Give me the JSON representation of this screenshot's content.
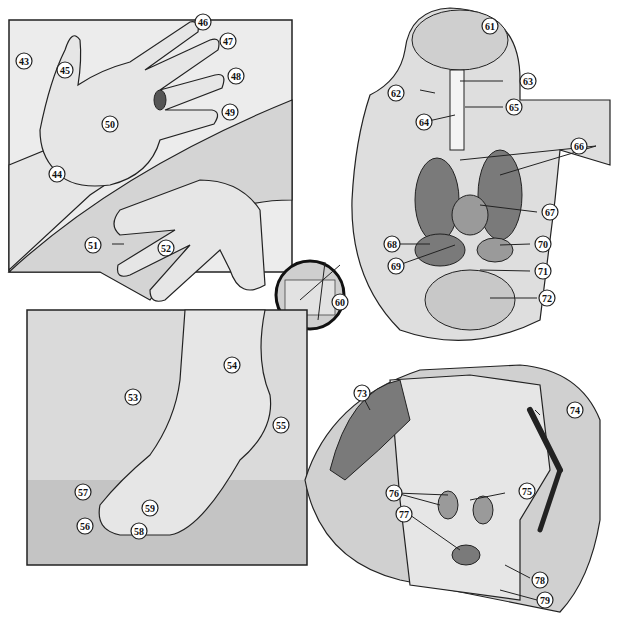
{
  "panels": [
    {
      "id": "hands",
      "description": "Palm and back of hands",
      "labels": [
        "43",
        "44",
        "45",
        "46",
        "47",
        "48",
        "49",
        "50",
        "51",
        "52"
      ]
    },
    {
      "id": "hair-follicle-inset",
      "description": "Magnified skin section with hair follicle",
      "labels": [
        "60"
      ]
    },
    {
      "id": "head-torso-organs",
      "description": "Sagittal head and torso showing internal organs",
      "labels": [
        "61",
        "62",
        "63",
        "64",
        "65",
        "66",
        "67",
        "68",
        "69",
        "70",
        "71",
        "72"
      ]
    },
    {
      "id": "foot",
      "description": "Foot standing on wooden floor",
      "labels": [
        "53",
        "54",
        "55",
        "56",
        "57",
        "58",
        "59"
      ]
    },
    {
      "id": "torso-muscles-skeleton",
      "description": "Torso with muscles, skeleton arm, kidneys and bladder",
      "labels": [
        "73",
        "74",
        "75",
        "76",
        "77",
        "78",
        "79"
      ]
    }
  ],
  "labels": {
    "l43": "43",
    "l44": "44",
    "l45": "45",
    "l46": "46",
    "l47": "47",
    "l48": "48",
    "l49": "49",
    "l50": "50",
    "l51": "51",
    "l52": "52",
    "l53": "53",
    "l54": "54",
    "l55": "55",
    "l56": "56",
    "l57": "57",
    "l58": "58",
    "l59": "59",
    "l60": "60",
    "l61": "61",
    "l62": "62",
    "l63": "63",
    "l64": "64",
    "l65": "65",
    "l66": "66",
    "l67": "67",
    "l68": "68",
    "l69": "69",
    "l70": "70",
    "l71": "71",
    "l72": "72",
    "l73": "73",
    "l74": "74",
    "l75": "75",
    "l76": "76",
    "l77": "77",
    "l78": "78",
    "l79": "79"
  }
}
